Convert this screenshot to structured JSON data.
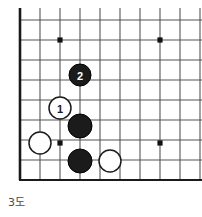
{
  "figure": {
    "caption": "3도",
    "kind": "go-board-diagram"
  },
  "board": {
    "origin_x": 20,
    "origin_y": 20,
    "spacing": 20,
    "cols": 10,
    "rows": 8,
    "left_edge_x": 20,
    "bottom_edge_y": 180,
    "line_color": "#555555",
    "edge_color": "#1a1a1a",
    "background": "#ffffff",
    "star_points": [
      {
        "name": "star-point-upper-left",
        "x": 60,
        "y": 40
      },
      {
        "name": "star-point-upper-right",
        "x": 160,
        "y": 40
      },
      {
        "name": "star-point-lower-left",
        "x": 60,
        "y": 143
      },
      {
        "name": "star-point-lower-right",
        "x": 160,
        "y": 143
      }
    ],
    "star_color": "#111111",
    "star_radius": 2.6
  },
  "stones": [
    {
      "name": "black-stone-move-2",
      "color": "black",
      "fill": "#1b1b1b",
      "stroke": "#000000",
      "x": 80,
      "y": 75,
      "r": 11,
      "label": "2",
      "label_color": "#ffffff"
    },
    {
      "name": "white-stone-move-1",
      "color": "white",
      "fill": "#ffffff",
      "stroke": "#1b1b1b",
      "x": 60,
      "y": 108,
      "r": 11,
      "label": "1",
      "label_color": "#1b1b1b"
    },
    {
      "name": "black-stone-center",
      "color": "black",
      "fill": "#1b1b1b",
      "stroke": "#000000",
      "x": 80,
      "y": 126,
      "r": 12,
      "label": "",
      "label_color": "#ffffff"
    },
    {
      "name": "white-stone-left",
      "color": "white",
      "fill": "#ffffff",
      "stroke": "#1b1b1b",
      "x": 40,
      "y": 143,
      "r": 11,
      "label": "",
      "label_color": "#1b1b1b"
    },
    {
      "name": "black-stone-lower",
      "color": "black",
      "fill": "#1b1b1b",
      "stroke": "#000000",
      "x": 80,
      "y": 161,
      "r": 12,
      "label": "",
      "label_color": "#ffffff"
    },
    {
      "name": "white-stone-lower-right",
      "color": "white",
      "fill": "#ffffff",
      "stroke": "#1b1b1b",
      "x": 110,
      "y": 161,
      "r": 11,
      "label": "",
      "label_color": "#1b1b1b"
    }
  ]
}
